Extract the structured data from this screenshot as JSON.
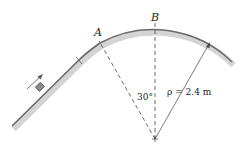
{
  "diagram": {
    "labels": {
      "point_a": "A",
      "point_b": "B",
      "angle": "30°",
      "radius": "ρ = 2.4 m"
    },
    "elements": {
      "track": "straight incline joining circular arc",
      "block": "small block on incline",
      "motion_arrow": "arrow indicating direction up the incline",
      "center": "center of curvature"
    },
    "colors": {
      "track_fill": "#b5b5b5",
      "track_edge": "#6e6e6e",
      "line": "#444444",
      "text": "#222222"
    }
  }
}
